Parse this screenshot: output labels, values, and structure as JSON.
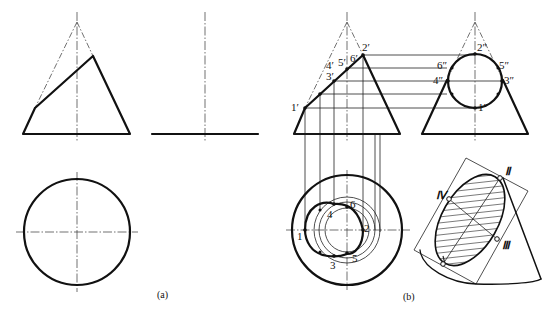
{
  "figure_a": {
    "caption": "(a)",
    "views": [
      "front-view",
      "side-view",
      "top-view"
    ]
  },
  "figure_b": {
    "caption": "(b)",
    "front_labels": [
      "1′",
      "2′",
      "3′",
      "4′",
      "5′",
      "6′"
    ],
    "side_labels": [
      "1″",
      "2″",
      "3″",
      "4″",
      "5″",
      "6″"
    ],
    "top_labels": [
      "1",
      "2",
      "3",
      "4",
      "5",
      "6"
    ],
    "pictorial_labels": [
      "Ⅱ",
      "Ⅲ",
      "Ⅳ"
    ]
  }
}
